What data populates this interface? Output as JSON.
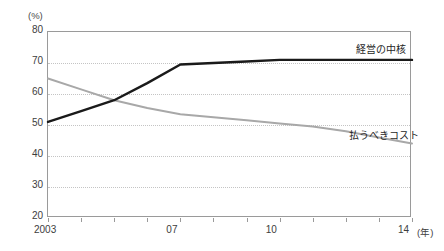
{
  "title": "",
  "unit_label": "(%)",
  "axis": {
    "x_unit": "(年)",
    "y_ticks": [
      "80",
      "70",
      "60",
      "50",
      "40",
      "30",
      "20"
    ],
    "x_ticks": [
      "2003",
      "07",
      "10",
      "14"
    ]
  },
  "legend": {
    "core": "経営の中核",
    "cost": "払うべきコスト"
  },
  "colors": {
    "core_line": "#1a1a1a",
    "cost_line": "#a8a8a8",
    "grid": "#c4c4c4",
    "frame": "#9a9a9a"
  },
  "chart_data": {
    "type": "line",
    "title": "",
    "xlabel": "(年)",
    "ylabel": "(%)",
    "ylim": [
      20,
      80
    ],
    "xlim": [
      2003,
      2014
    ],
    "grid": true,
    "legend_position": "inline-right",
    "yticks": [
      80,
      70,
      60,
      50,
      40,
      30,
      20
    ],
    "xtick_labels": [
      "2003",
      "07",
      "10",
      "14"
    ],
    "xtick_values": [
      2003,
      2007,
      2010,
      2014
    ],
    "x": [
      2003,
      2004,
      2005,
      2006,
      2007,
      2008,
      2009,
      2010,
      2011,
      2012,
      2013,
      2014
    ],
    "series": [
      {
        "name": "経営の中核",
        "color": "#1a1a1a",
        "values": [
          51.0,
          54.5,
          58.0,
          63.5,
          69.5,
          70.0,
          70.5,
          71.0,
          71.0,
          71.0,
          71.0,
          71.0
        ]
      },
      {
        "name": "払うべきコスト",
        "color": "#a8a8a8",
        "values": [
          65.0,
          61.5,
          58.0,
          55.5,
          53.5,
          52.5,
          51.5,
          50.5,
          49.5,
          48.0,
          46.0,
          44.0
        ]
      }
    ]
  }
}
